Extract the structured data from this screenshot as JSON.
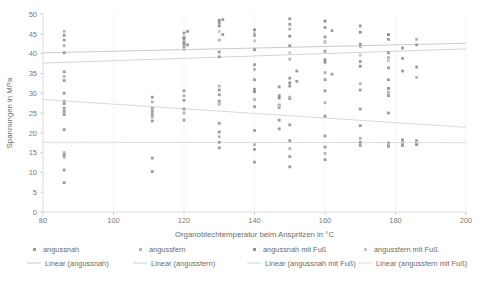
{
  "chart_data": {
    "type": "scatter",
    "title": "",
    "xlabel": "Organoblechtemperatur beim Anspritzen in °C",
    "ylabel": "Spannungen in MPa",
    "xlim": [
      80,
      200
    ],
    "ylim": [
      0,
      50
    ],
    "xticks": [
      80,
      100,
      120,
      140,
      160,
      180,
      200
    ],
    "yticks": [
      0,
      5,
      10,
      15,
      20,
      25,
      30,
      35,
      40,
      45,
      50
    ],
    "grid": "vertical",
    "legend_position": "bottom",
    "series": [
      {
        "name": "angussnah",
        "color": "#9b9b9b",
        "marker": "square",
        "points": [
          [
            86,
            44.6
          ],
          [
            86,
            43.4
          ],
          [
            86,
            40.2
          ],
          [
            86,
            35.4
          ],
          [
            86,
            33.2
          ],
          [
            86,
            30.0
          ],
          [
            86,
            27.4
          ],
          [
            86,
            26.2
          ],
          [
            86,
            25.4
          ],
          [
            86,
            24.6
          ],
          [
            86,
            20.8
          ],
          [
            86,
            14.6
          ],
          [
            86,
            14.2
          ],
          [
            86,
            10.6
          ],
          [
            86,
            7.4
          ],
          [
            111,
            29.0
          ],
          [
            111,
            26.2
          ],
          [
            111,
            25.4
          ],
          [
            111,
            24.6
          ],
          [
            111,
            23.0
          ],
          [
            111,
            13.6
          ],
          [
            111,
            10.2
          ],
          [
            120,
            45.2
          ],
          [
            120,
            44.0
          ],
          [
            120,
            43.0
          ],
          [
            120,
            41.6
          ],
          [
            120,
            30.6
          ],
          [
            120,
            28.2
          ],
          [
            120,
            26.0
          ],
          [
            120,
            23.2
          ],
          [
            121,
            45.6
          ],
          [
            121,
            42.2
          ],
          [
            130,
            47.8
          ],
          [
            130,
            40.4
          ],
          [
            130,
            39.2
          ],
          [
            130,
            30.8
          ],
          [
            130,
            29.6
          ],
          [
            130,
            28.0
          ],
          [
            130,
            22.4
          ],
          [
            130,
            20.2
          ],
          [
            130,
            17.6
          ],
          [
            130,
            16.2
          ],
          [
            131,
            48.6
          ],
          [
            131,
            44.8
          ],
          [
            140,
            44.6
          ],
          [
            140,
            41.0
          ],
          [
            140,
            37.2
          ],
          [
            140,
            33.4
          ],
          [
            140,
            31.0
          ],
          [
            140,
            26.6
          ],
          [
            140,
            20.6
          ],
          [
            140,
            15.8
          ],
          [
            140,
            12.6
          ],
          [
            147,
            31.6
          ],
          [
            147,
            29.4
          ],
          [
            147,
            26.4
          ],
          [
            147,
            23.2
          ],
          [
            147,
            21.0
          ],
          [
            150,
            48.8
          ],
          [
            150,
            47.4
          ],
          [
            150,
            42.0
          ],
          [
            150,
            33.8
          ],
          [
            150,
            31.8
          ],
          [
            150,
            28.6
          ],
          [
            150,
            22.0
          ],
          [
            150,
            18.0
          ],
          [
            150,
            14.0
          ],
          [
            150,
            11.4
          ],
          [
            152,
            35.6
          ],
          [
            152,
            33.0
          ],
          [
            160,
            46.6
          ],
          [
            160,
            44.2
          ],
          [
            160,
            40.6
          ],
          [
            160,
            37.8
          ],
          [
            160,
            33.4
          ],
          [
            160,
            30.6
          ],
          [
            160,
            24.2
          ],
          [
            160,
            19.2
          ],
          [
            160,
            16.4
          ],
          [
            160,
            13.2
          ],
          [
            162,
            45.8
          ],
          [
            162,
            34.8
          ],
          [
            170,
            47.0
          ],
          [
            170,
            42.4
          ],
          [
            170,
            38.0
          ],
          [
            170,
            30.8
          ],
          [
            170,
            26.0
          ],
          [
            170,
            21.8
          ],
          [
            170,
            17.6
          ],
          [
            170,
            16.8
          ],
          [
            178,
            43.6
          ],
          [
            178,
            40.2
          ],
          [
            178,
            36.4
          ],
          [
            178,
            33.4
          ],
          [
            178,
            29.4
          ],
          [
            178,
            25.0
          ],
          [
            178,
            17.4
          ],
          [
            178,
            16.6
          ],
          [
            182,
            41.4
          ],
          [
            182,
            38.8
          ],
          [
            182,
            35.6
          ],
          [
            182,
            17.2
          ],
          [
            182,
            16.8
          ],
          [
            186,
            42.2
          ],
          [
            186,
            36.6
          ],
          [
            186,
            18.0
          ],
          [
            186,
            17.0
          ]
        ]
      },
      {
        "name": "angussfern",
        "color": "#b4b4b4",
        "marker": "square",
        "points": [
          [
            86,
            45.6
          ],
          [
            86,
            42.0
          ],
          [
            86,
            34.2
          ],
          [
            86,
            28.0
          ],
          [
            86,
            25.0
          ],
          [
            86,
            15.0
          ],
          [
            86,
            13.8
          ],
          [
            111,
            27.8
          ],
          [
            111,
            25.8
          ],
          [
            111,
            24.0
          ],
          [
            120,
            44.2
          ],
          [
            120,
            42.6
          ],
          [
            120,
            29.4
          ],
          [
            120,
            25.0
          ],
          [
            130,
            43.4
          ],
          [
            130,
            31.8
          ],
          [
            130,
            27.2
          ],
          [
            130,
            19.0
          ],
          [
            140,
            45.0
          ],
          [
            140,
            36.0
          ],
          [
            140,
            28.4
          ],
          [
            140,
            17.0
          ],
          [
            150,
            46.2
          ],
          [
            150,
            38.6
          ],
          [
            150,
            29.0
          ],
          [
            150,
            16.0
          ],
          [
            160,
            43.0
          ],
          [
            160,
            35.2
          ],
          [
            160,
            27.6
          ],
          [
            160,
            14.8
          ],
          [
            170,
            41.8
          ],
          [
            170,
            32.4
          ],
          [
            170,
            18.6
          ],
          [
            178,
            39.0
          ],
          [
            178,
            30.2
          ],
          [
            178,
            17.2
          ],
          [
            186,
            43.6
          ],
          [
            186,
            34.0
          ],
          [
            186,
            17.4
          ]
        ]
      },
      {
        "name": "angussnah mit Fuß",
        "color": "#8f8f8f",
        "marker": "square",
        "points": [
          [
            120,
            43.8
          ],
          [
            120,
            42.4
          ],
          [
            130,
            48.4
          ],
          [
            130,
            47.0
          ],
          [
            140,
            46.0
          ],
          [
            140,
            30.4
          ],
          [
            147,
            28.8
          ],
          [
            147,
            27.0
          ],
          [
            150,
            44.4
          ],
          [
            150,
            32.6
          ],
          [
            160,
            48.2
          ],
          [
            160,
            38.4
          ],
          [
            170,
            45.4
          ],
          [
            170,
            36.8
          ],
          [
            178,
            44.8
          ],
          [
            178,
            31.2
          ],
          [
            182,
            18.2
          ],
          [
            182,
            17.8
          ],
          [
            186,
            17.8
          ],
          [
            186,
            17.2
          ]
        ]
      },
      {
        "name": "angussfern mit Fuß",
        "color": "#c6c6c6",
        "marker": "square",
        "points": [
          [
            120,
            41.0
          ],
          [
            130,
            45.6
          ],
          [
            140,
            43.2
          ],
          [
            147,
            26.8
          ],
          [
            150,
            40.2
          ],
          [
            160,
            42.8
          ],
          [
            170,
            39.6
          ],
          [
            178,
            38.2
          ],
          [
            182,
            17.6
          ],
          [
            186,
            17.6
          ]
        ]
      }
    ],
    "trendlines": [
      {
        "name": "Linear (angussnah)",
        "color": "#bdbdbd",
        "x0": 80,
        "y0": 40.2,
        "x1": 200,
        "y1": 42.6
      },
      {
        "name": "Linear (angussfern)",
        "color": "#c9c9c9",
        "x0": 80,
        "y0": 37.6,
        "x1": 200,
        "y1": 41.2
      },
      {
        "name": "Linear (angussnah mit Fuß)",
        "color": "#cfcfcf",
        "x0": 80,
        "y0": 28.4,
        "x1": 200,
        "y1": 21.4
      },
      {
        "name": "Linear (angussfern mit Fuß)",
        "color": "#d6d6d6",
        "x0": 80,
        "y0": 17.6,
        "x1": 200,
        "y1": 17.5
      }
    ]
  },
  "legend": {
    "markers": [
      {
        "label": "angussnah",
        "color": "#9b9b9b"
      },
      {
        "label": "angussfern",
        "color": "#b4b4b4"
      },
      {
        "label": "angussnah mit Fuß",
        "color": "#8f8f8f"
      },
      {
        "label": "angussfern mit Fuß",
        "color": "#c6c6c6"
      }
    ],
    "lines": [
      {
        "label": "Linear (angussnah)",
        "color": "#bdbdbd"
      },
      {
        "label": "Linear (angussfern)",
        "color": "#c9c9c9"
      },
      {
        "label": "Linear (angussnah mit Fuß)",
        "color": "#cfcfcf"
      },
      {
        "label": "Linear (angussfern mit Fuß)",
        "color": "#d6d6d6"
      }
    ]
  }
}
